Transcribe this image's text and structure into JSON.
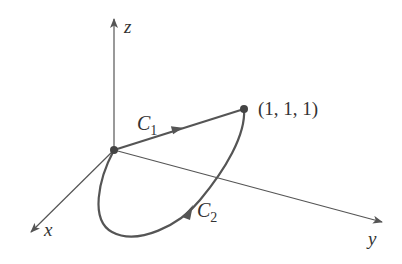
{
  "diagram": {
    "colors": {
      "axis": "#555555",
      "curve": "#555555",
      "text": "#333333",
      "background": "#ffffff"
    },
    "axes": {
      "z": {
        "label": "z"
      },
      "x": {
        "label": "x"
      },
      "y": {
        "label": "y"
      }
    },
    "curves": {
      "c1": {
        "label": "C",
        "subscript": "1"
      },
      "c2": {
        "label": "C",
        "subscript": "2"
      }
    },
    "point": {
      "label": "(1, 1, 1)"
    }
  }
}
